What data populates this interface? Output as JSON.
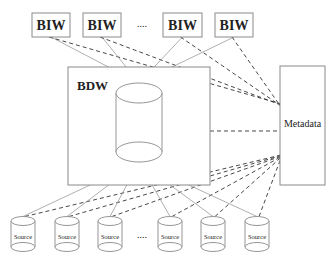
{
  "diagram": {
    "biw_boxes": [
      {
        "label": "BIW",
        "x": 32,
        "y": 13,
        "w": 38,
        "h": 24
      },
      {
        "label": "BIW",
        "x": 83,
        "y": 13,
        "w": 38,
        "h": 24
      },
      {
        "label": "BIW",
        "x": 163,
        "y": 13,
        "w": 39,
        "h": 24
      },
      {
        "label": "BIW",
        "x": 215,
        "y": 13,
        "w": 38,
        "h": 24
      }
    ],
    "biw_ellipsis": "....",
    "bdw": {
      "label": "BDW",
      "x": 68,
      "y": 67,
      "w": 142,
      "h": 118
    },
    "warehouse_cylinder": {
      "cx": 139,
      "top": 93,
      "bottom": 152,
      "rx": 23,
      "ry": 10
    },
    "metadata": {
      "label": "Metadata",
      "x": 280,
      "y": 66,
      "w": 45,
      "h": 119
    },
    "sources": [
      {
        "label": "Source",
        "cx": 23
      },
      {
        "label": "Source",
        "cx": 67
      },
      {
        "label": "Source",
        "cx": 110
      },
      {
        "label": "Source",
        "cx": 170
      },
      {
        "label": "Source",
        "cx": 213
      },
      {
        "label": "Source",
        "cx": 257
      }
    ],
    "source_ellipsis": "....",
    "source_cylinder": {
      "top": 221,
      "bottom": 247,
      "rx": 12,
      "ry": 4.5
    }
  }
}
